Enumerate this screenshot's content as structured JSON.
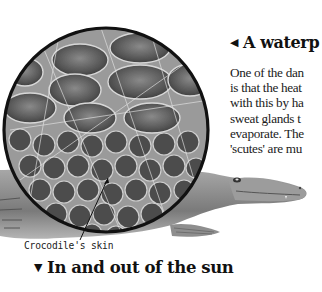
{
  "page": {
    "section_heading": {
      "arrow": "◀",
      "text": "A waterp"
    },
    "body_lines": [
      "One of the dan",
      "is that the heat",
      "with this by ha",
      "sweat glands t",
      "evaporate. The",
      "'scutes' are mu"
    ],
    "illustration": {
      "subject": "crocodile",
      "magnified_inset": "crocodile skin scutes"
    },
    "caption": "Crocodile's skin",
    "next_heading": {
      "arrow": "▼",
      "text": "In and out of the sun"
    }
  }
}
